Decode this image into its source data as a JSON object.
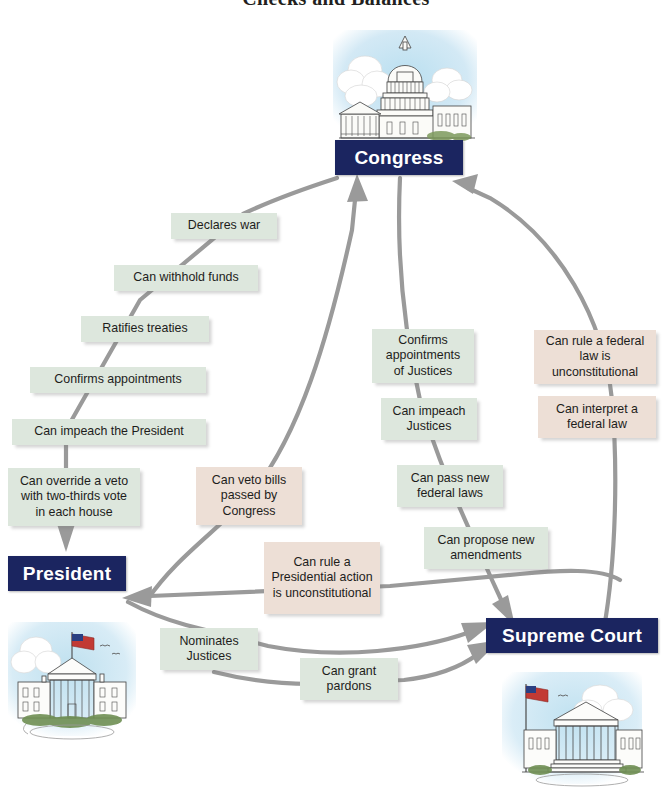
{
  "title": "Checks and Balances",
  "branches": [
    {
      "id": "congress",
      "label": "Congress"
    },
    {
      "id": "president",
      "label": "President"
    },
    {
      "id": "supreme-court",
      "label": "Supreme Court"
    }
  ],
  "illustrations": [
    {
      "id": "capitol-building",
      "name": "us-capitol-illustration"
    },
    {
      "id": "white-house-building",
      "name": "white-house-illustration"
    },
    {
      "id": "supreme-court-building",
      "name": "supreme-court-illustration"
    }
  ],
  "powers": {
    "congress_over_president": [
      {
        "id": "declares-war",
        "text": "Declares war"
      },
      {
        "id": "can-withhold-funds",
        "text": "Can withhold funds"
      },
      {
        "id": "ratifies-treaties",
        "text": "Ratifies treaties"
      },
      {
        "id": "confirms-appointments",
        "text": "Confirms appointments"
      },
      {
        "id": "can-impeach-president",
        "text": "Can impeach the President"
      },
      {
        "id": "can-override-veto",
        "text": "Can override a veto with two-thirds vote in each house"
      }
    ],
    "president_over_congress": [
      {
        "id": "can-veto-bills",
        "text": "Can veto bills passed by Congress"
      }
    ],
    "congress_over_court": [
      {
        "id": "confirms-justices",
        "text": "Confirms appointments of Justices"
      },
      {
        "id": "can-impeach-justices",
        "text": "Can impeach Justices"
      },
      {
        "id": "can-pass-federal-laws",
        "text": "Can pass new federal laws"
      },
      {
        "id": "can-propose-amendments",
        "text": "Can propose new amendments"
      }
    ],
    "court_over_congress": [
      {
        "id": "federal-law-unconstitutional",
        "text": "Can rule a federal law is unconstitutional"
      },
      {
        "id": "can-interpret-federal-law",
        "text": "Can interpret a federal law"
      }
    ],
    "court_over_president": [
      {
        "id": "presidential-action-unconstitutional",
        "text": "Can rule a Presidential action is unconstitutional"
      }
    ],
    "president_over_court": [
      {
        "id": "nominates-justices",
        "text": "Nominates Justices"
      },
      {
        "id": "can-grant-pardons",
        "text": "Can grant pardons"
      }
    ]
  },
  "colors": {
    "branch_plate": "#1b2560",
    "chip_green": "#dde7dd",
    "chip_pink": "#eddfd6",
    "connector": "#9a9a9a",
    "title_text": "#231f20",
    "page_background": "#ffffff",
    "sky": "#cfe7f2"
  }
}
